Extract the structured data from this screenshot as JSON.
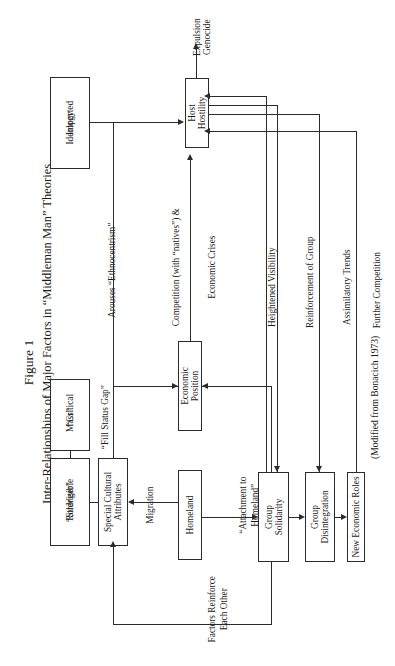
{
  "figure": {
    "number_label": "Figure 1",
    "title": "Inter-Relationships of Major Factors in “Middleman Man” Theories",
    "credit": "(Modified from Bonacich 1973)"
  },
  "nodes": {
    "imported_ideology": "Imported\nIdeology",
    "imported_ideology_l1": "Imported",
    "imported_ideology_l2": "Ideology",
    "host_hostility_l1": "Host",
    "host_hostility_l2": "Hostility",
    "critical_mass_l1": "“Critical",
    "critical_mass_l2": "Mass”",
    "visible_stranger_l1": "Visible",
    "visible_stranger_l2": "“Stranger”",
    "visible_stranger_l3": "Role",
    "special_cultural_l1": "Special Cultural",
    "special_cultural_l2": "Attributes",
    "economic_position_l1": "Economic",
    "economic_position_l2": "Position",
    "homeland": "Homeland",
    "group_solidarity_l1": "Group",
    "group_solidarity_l2": "Solidarity",
    "group_disintegration_l1": "Group",
    "group_disintegration_l2": "Disintegration",
    "new_economic_roles": "New Economic Roles"
  },
  "outcomes": {
    "expulsion": "Expulsion",
    "genocide": "Genocide"
  },
  "edge_labels": {
    "arouses_ethnocentrism": "Arouses “Ethnocentrism”",
    "fill_status_gap": "“Fill Status Gap”",
    "competition_l1": "Competition (with “natives”) &",
    "competition_l2": "Economic Crises",
    "heightened_visibility": "Heightened Visibility",
    "reinforcement_of_group": "Reinforcement of Group",
    "assimilatory_trends": "Assimilatory Trends",
    "further_competition": "Further Competition",
    "migration": "Migration",
    "attachment_to_homeland_l1": "“Attachment to",
    "attachment_to_homeland_l2": "Homeland”",
    "factors_reinforce_l1": "Factors Reinforce",
    "factors_reinforce_l2": "Each Other"
  },
  "colors": {
    "ink": "#2b2b2b",
    "paper": "#ffffff"
  }
}
